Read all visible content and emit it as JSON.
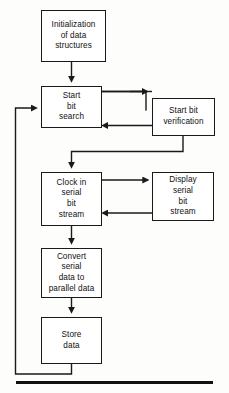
{
  "diagram": {
    "background_color": "#fdfdfb",
    "line_color": "#1a1a1a",
    "text_color": "#101010",
    "nodes": [
      {
        "id": "initialization",
        "label": "Initialization\nof data\nstructures"
      },
      {
        "id": "start-bit-search",
        "label": "Start\nbit\nsearch"
      },
      {
        "id": "start-bit-verification",
        "label": "Start bit\nverification"
      },
      {
        "id": "clock-in-serial-bit-stream",
        "label": "Clock in\nserial\nbit\nstream"
      },
      {
        "id": "display-serial-bit-stream",
        "label": "Display\nserial\nbit\nstream"
      },
      {
        "id": "convert-serial-data",
        "label": "Convert\nserial\ndata to\nparallel data"
      },
      {
        "id": "store-data",
        "label": "Store\ndata"
      }
    ],
    "edges": [
      {
        "id": "init-to-start",
        "from": "initialization",
        "to": "start-bit-search",
        "style": "straight-down"
      },
      {
        "id": "start-to-verify",
        "from": "start-bit-search",
        "to": "start-bit-verification",
        "style": "straight-right"
      },
      {
        "id": "verify-to-start",
        "from": "start-bit-verification",
        "to": "start-bit-search",
        "style": "straight-left"
      },
      {
        "id": "verify-to-clock",
        "from": "start-bit-verification",
        "to": "clock-in-serial-bit-stream",
        "style": "elbow-down-left"
      },
      {
        "id": "clock-to-display",
        "from": "clock-in-serial-bit-stream",
        "to": "display-serial-bit-stream",
        "style": "straight-right"
      },
      {
        "id": "display-to-clock",
        "from": "display-serial-bit-stream",
        "to": "clock-in-serial-bit-stream",
        "style": "straight-left"
      },
      {
        "id": "clock-to-convert",
        "from": "clock-in-serial-bit-stream",
        "to": "convert-serial-data",
        "style": "straight-down"
      },
      {
        "id": "convert-to-store",
        "from": "convert-serial-data",
        "to": "store-data",
        "style": "straight-down"
      },
      {
        "id": "store-to-start-feedback",
        "from": "store-data",
        "to": "start-bit-search",
        "style": "loop-left-up"
      }
    ],
    "bottom_rule": {
      "id": "bottom-rule",
      "visible": true
    }
  }
}
